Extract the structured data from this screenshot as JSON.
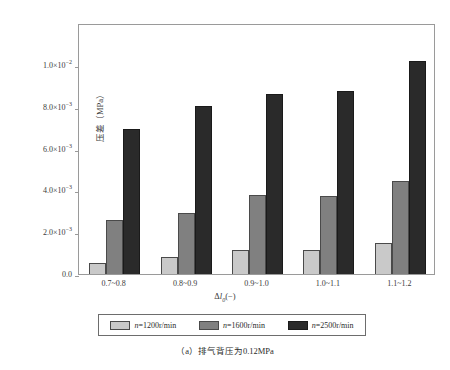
{
  "chart_data": {
    "type": "bar",
    "title": "",
    "categories": [
      "0.7~0.8",
      "0.8~0.9",
      "0.9~1.0",
      "1.0~1.1",
      "1.1~1.2"
    ],
    "series": [
      {
        "name": "n=1200r/min",
        "color": "#c9c9c9",
        "values": [
          0.00052,
          0.00082,
          0.00113,
          0.00113,
          0.0015
        ]
      },
      {
        "name": "n=1600r/min",
        "color": "#808080",
        "values": [
          0.0026,
          0.0029,
          0.00377,
          0.00375,
          0.00446
        ]
      },
      {
        "name": "n=2500r/min",
        "color": "#2a2a2a",
        "values": [
          0.00693,
          0.00805,
          0.00861,
          0.00874,
          0.0102
        ]
      }
    ],
    "xlabel": "Δl₀(−)",
    "ylabel": "压差（MPa）",
    "ylim": [
      0,
      0.012
    ],
    "yticks": [
      0,
      0.002,
      0.004,
      0.006,
      0.008,
      0.01
    ],
    "ytick_labels": [
      "0.0",
      "2.0×10⁻³",
      "4.0×10⁻³",
      "6.0×10⁻³",
      "8.0×10⁻³",
      "1.0×10⁻²"
    ],
    "grid": false,
    "legend_position": "bottom"
  },
  "axes": {
    "y_title_main": "压差（MPa）",
    "x_title_delta": "Δ",
    "x_title_l": "l",
    "x_title_sub": "0",
    "x_title_unit": "(−)",
    "ytick_labels": [
      {
        "mantissa": "1.0×10",
        "exp": "−2"
      },
      {
        "mantissa": "8.0×10",
        "exp": "−3"
      },
      {
        "mantissa": "6.0×10",
        "exp": "−3"
      },
      {
        "mantissa": "4.0×10",
        "exp": "−3"
      },
      {
        "mantissa": "2.0×10",
        "exp": "−3"
      },
      {
        "mantissa": "0.0",
        "exp": ""
      }
    ]
  },
  "legend": {
    "items": [
      {
        "label_var": "n",
        "label_rest": "=1200r/min"
      },
      {
        "label_var": "n",
        "label_rest": "=1600r/min"
      },
      {
        "label_var": "n",
        "label_rest": "=2500r/min"
      }
    ]
  },
  "caption": {
    "text": "（a）排气背压为0.12MPa"
  }
}
